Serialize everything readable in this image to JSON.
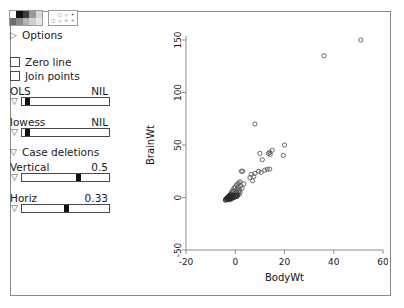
{
  "panel": {
    "palette_icon": "color-swatch-palette-icon",
    "symbol_icon": "plot-symbol-palette-icon",
    "swatch_colors": [
      "#ffffff",
      "#111111",
      "#3c3c3c",
      "#9a9a9a",
      "#d8d8d8",
      "#6e6e6e",
      "#8d8d8d",
      "#b4b4b4",
      "#cfcfcf",
      "#e8e8e8"
    ],
    "symbol_glyphs": [
      "·",
      "□",
      "◇",
      "✦",
      "□",
      "◇",
      "✕",
      "✕"
    ],
    "options": {
      "label": "Options",
      "disclosure": "collapsed",
      "glyph": "▷"
    },
    "checkboxes": [
      {
        "label": "Zero line",
        "checked": false
      },
      {
        "label": "Join points",
        "checked": false
      }
    ],
    "case_deletions": {
      "label": "Case deletions",
      "disclosure": "expanded",
      "glyph": "▽"
    },
    "sliders": [
      {
        "name": "ols",
        "label": "OLS",
        "value": "NIL",
        "handle_pct": 3,
        "arrow": "▽"
      },
      {
        "name": "lowess",
        "label": "lowess",
        "value": "NIL",
        "handle_pct": 3,
        "arrow": "▽"
      },
      {
        "name": "vertical",
        "label": "Vertical",
        "value": "0.5",
        "handle_pct": 62,
        "arrow": "▽"
      },
      {
        "name": "horiz",
        "label": "Horiz",
        "value": "0.33",
        "handle_pct": 48,
        "arrow": "▽"
      }
    ]
  },
  "chart_data": {
    "type": "scatter",
    "title": "",
    "xlabel": "BodyWt",
    "ylabel": "BrainWt",
    "xlim": [
      -20,
      60
    ],
    "ylim": [
      -50,
      150
    ],
    "xticks": [
      -20,
      0,
      20,
      40,
      60
    ],
    "yticks": [
      -50,
      0,
      50,
      100,
      150
    ],
    "grid": false,
    "legend": "none",
    "marker": "open-circle",
    "points": [
      [
        51,
        150
      ],
      [
        36,
        135
      ],
      [
        8,
        70
      ],
      [
        20,
        50
      ],
      [
        15,
        45
      ],
      [
        14,
        43
      ],
      [
        13.5,
        42
      ],
      [
        10,
        42
      ],
      [
        14.2,
        41
      ],
      [
        19.5,
        40
      ],
      [
        11,
        36
      ],
      [
        13,
        27
      ],
      [
        14,
        27
      ],
      [
        12,
        26
      ],
      [
        2.5,
        25
      ],
      [
        3,
        25
      ],
      [
        9.5,
        25
      ],
      [
        10.5,
        24
      ],
      [
        8,
        23
      ],
      [
        6.5,
        22
      ],
      [
        7.5,
        20
      ],
      [
        6,
        19
      ],
      [
        7,
        16
      ],
      [
        2,
        15
      ],
      [
        1.5,
        14
      ],
      [
        1,
        13
      ],
      [
        3.5,
        13
      ],
      [
        0.5,
        12
      ],
      [
        2.2,
        11
      ],
      [
        0,
        10
      ],
      [
        1.2,
        10
      ],
      [
        -0.5,
        9
      ],
      [
        2.8,
        9
      ],
      [
        0.8,
        8
      ],
      [
        -1,
        7
      ],
      [
        1.8,
        7
      ],
      [
        0.2,
        6
      ],
      [
        -0.8,
        6
      ],
      [
        1.4,
        5.5
      ],
      [
        -1.5,
        5
      ],
      [
        0.6,
        5
      ],
      [
        2,
        5
      ],
      [
        -0.3,
        4
      ],
      [
        1,
        4
      ],
      [
        -1.8,
        3.5
      ],
      [
        0.4,
        3
      ],
      [
        -1.2,
        3
      ],
      [
        1.6,
        3
      ],
      [
        -2,
        2.5
      ],
      [
        -0.6,
        2
      ],
      [
        0.9,
        2
      ],
      [
        -2.3,
        2
      ],
      [
        -1.4,
        1.5
      ],
      [
        0.1,
        1.5
      ],
      [
        -2.6,
        1
      ],
      [
        -1.9,
        1
      ],
      [
        -0.9,
        1
      ],
      [
        0.7,
        1
      ],
      [
        -3,
        0.5
      ],
      [
        -2.2,
        0.5
      ],
      [
        -1.5,
        0
      ],
      [
        -0.4,
        0
      ],
      [
        -2.8,
        0
      ],
      [
        -3.4,
        -0.5
      ],
      [
        -2.5,
        -0.5
      ],
      [
        -1.1,
        -0.5
      ],
      [
        -3.2,
        -1
      ],
      [
        -2,
        -1
      ],
      [
        -3.8,
        -1.5
      ],
      [
        -2.9,
        -1.5
      ],
      [
        -1.7,
        -1.5
      ],
      [
        -3.5,
        -2
      ],
      [
        -2.4,
        -2
      ],
      [
        -4,
        -2.5
      ]
    ]
  }
}
